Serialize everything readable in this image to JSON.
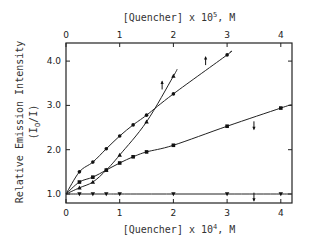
{
  "chart_data": {
    "type": "line",
    "title": "",
    "xlabel": "[Quencher] x 10^4, M",
    "xlabel_main": "[Quencher] x 10",
    "xlabel_exp": "4",
    "xlabel_unit": ", M",
    "x2label": "[Quencher] x 10^5, M",
    "x2label_main": "[Quencher] x 10",
    "x2label_exp": "5",
    "x2label_unit": ", M",
    "ylabel_line1": "Relative Emission Intensity",
    "ylabel_line2": "(I",
    "ylabel_sub": "O",
    "ylabel_line2_end": "/I)",
    "xlim": [
      0,
      4.2
    ],
    "ylim": [
      0.85,
      4.35
    ],
    "x_ticks": [
      0,
      1,
      2,
      3,
      4
    ],
    "x_tick_labels": [
      "0",
      "1",
      "2",
      "3",
      "4"
    ],
    "x2_ticks": [
      0,
      1,
      2,
      3,
      4
    ],
    "x2_tick_labels": [
      "0",
      "1",
      "2",
      "3",
      "4"
    ],
    "y_ticks": [
      1.0,
      2.0,
      3.0,
      4.0
    ],
    "y_tick_labels": [
      "1.0",
      "2.0",
      "3.0",
      "4.0"
    ],
    "grid": false,
    "series": [
      {
        "name": "circles",
        "marker": "circle",
        "axis": "top",
        "x": [
          0,
          0.25,
          0.5,
          0.75,
          1.0,
          1.25,
          1.5,
          2.0,
          3.0
        ],
        "y": [
          1.0,
          1.5,
          1.72,
          2.02,
          2.31,
          2.56,
          2.78,
          3.26,
          4.14
        ],
        "line_end": [
          3.05,
          4.2
        ]
      },
      {
        "name": "triangles-up",
        "marker": "triangle-up",
        "axis": "top",
        "x": [
          0,
          0.25,
          0.5,
          0.75,
          1.0,
          1.5,
          2.0
        ],
        "y": [
          1.0,
          1.14,
          1.27,
          1.54,
          1.88,
          2.63,
          3.66
        ],
        "line_end": [
          2.07,
          3.82
        ]
      },
      {
        "name": "squares",
        "marker": "square",
        "axis": "bottom",
        "x": [
          0,
          0.25,
          0.5,
          0.75,
          1.0,
          1.25,
          1.5,
          2.0,
          3.0,
          4.0
        ],
        "y": [
          1.0,
          1.27,
          1.38,
          1.54,
          1.7,
          1.84,
          1.95,
          2.1,
          2.53,
          2.94
        ],
        "line_end": [
          4.2,
          3.02
        ]
      },
      {
        "name": "triangles-down",
        "marker": "triangle-down",
        "axis": "bottom",
        "x": [
          0,
          0.25,
          0.5,
          0.75,
          1.0,
          2.0,
          3.0,
          4.0
        ],
        "y": [
          1.0,
          1.0,
          1.0,
          1.0,
          1.0,
          1.0,
          1.0,
          1.0
        ],
        "line_end": [
          4.2,
          1.0
        ]
      }
    ],
    "annotations": [
      {
        "type": "arrow-up",
        "x": 1.79,
        "y": 3.45,
        "meaning": "read top axis"
      },
      {
        "type": "arrow-up",
        "x": 2.6,
        "y": 4.0,
        "meaning": "read top axis"
      },
      {
        "type": "arrow-down",
        "x": 3.5,
        "y": 2.55,
        "meaning": "read bottom axis"
      },
      {
        "type": "arrow-down",
        "x": 3.5,
        "y": 0.94,
        "meaning": "read bottom axis"
      }
    ]
  }
}
